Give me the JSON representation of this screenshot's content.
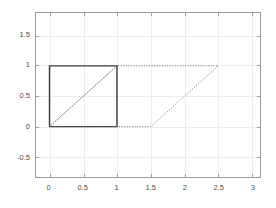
{
  "chart_data": {
    "type": "line",
    "title": "",
    "xlabel": "",
    "ylabel": "",
    "xlim": [
      -0.2,
      3.12
    ],
    "ylim": [
      -0.83,
      1.87
    ],
    "xticks": [
      0,
      0.5,
      1,
      1.5,
      2,
      2.5,
      3
    ],
    "xticklabels": [
      "0",
      "0.5",
      "1",
      "1.5",
      "2",
      "2.5",
      "3"
    ],
    "yticks": [
      -0.5,
      0,
      0.5,
      1,
      1.5
    ],
    "yticklabels": [
      "-0.5",
      "0",
      "0.5",
      "1",
      "1.5"
    ],
    "grid": true,
    "grid_color": "#ececec",
    "axes_color": "#9a9a9a",
    "background_color": "#ffffff",
    "legend": null,
    "series": [
      {
        "name": "unit-square",
        "style": "solid",
        "color": "#3a3a3a",
        "linewidth": 1.4,
        "closed": true,
        "x": [
          0,
          1,
          1,
          0,
          0
        ],
        "y": [
          0,
          0,
          1,
          1,
          0
        ]
      },
      {
        "name": "square-diagonal",
        "style": "dotted",
        "color": "#6e6e6e",
        "linewidth": 1,
        "closed": false,
        "x": [
          0,
          1
        ],
        "y": [
          0,
          1
        ]
      },
      {
        "name": "sheared-parallelogram",
        "style": "dotted",
        "color": "#6e6e6e",
        "linewidth": 1,
        "closed": true,
        "x": [
          0,
          1.5,
          2.5,
          1,
          0
        ],
        "y": [
          0,
          0,
          1,
          1,
          0
        ]
      }
    ],
    "annotations": []
  }
}
